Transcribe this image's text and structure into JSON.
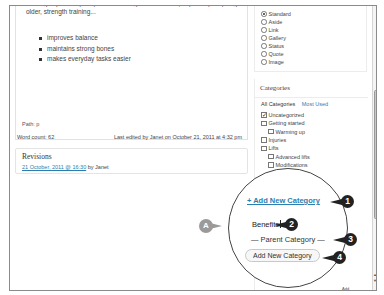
{
  "editor": {
    "cut_line": "training improves quality of life. Among other benefits, especially as you get",
    "intro_line": "older, strength training...",
    "bullets": [
      "improves balance",
      "maintains strong bones",
      "makes everyday tasks easier"
    ],
    "path": "Path: p",
    "word_count": "Word count: 62",
    "last_edited": "Last edited by Janet on October 21, 2011 at 4:32 pm"
  },
  "revisions": {
    "title": "Revisions",
    "entry_link": "21 October, 2011 @ 16:30",
    "entry_suffix": " by Janet"
  },
  "format": {
    "options": [
      {
        "label": "Standard",
        "selected": true
      },
      {
        "label": "Aside",
        "selected": false
      },
      {
        "label": "Link",
        "selected": false
      },
      {
        "label": "Gallery",
        "selected": false
      },
      {
        "label": "Status",
        "selected": false
      },
      {
        "label": "Quote",
        "selected": false
      },
      {
        "label": "Image",
        "selected": false
      }
    ]
  },
  "categories": {
    "title": "Categories",
    "tabs": [
      "All Categories",
      "Most Used"
    ],
    "items": [
      {
        "label": "Uncategorized",
        "checked": true,
        "child": false
      },
      {
        "label": "Getting started",
        "checked": false,
        "child": false
      },
      {
        "label": "Warming up",
        "checked": false,
        "child": true
      },
      {
        "label": "Injuries",
        "checked": false,
        "child": false
      },
      {
        "label": "Lifts",
        "checked": false,
        "child": false
      },
      {
        "label": "Advanced lifts",
        "checked": false,
        "child": true
      },
      {
        "label": "Modifications",
        "checked": false,
        "child": true
      }
    ]
  },
  "magnifier": {
    "add_link": "+ Add New Category",
    "input_value": "Benefits",
    "parent_select": "— Parent Category —",
    "add_button": "Add New Category"
  },
  "callouts": {
    "a": "A",
    "one": "1",
    "two": "2",
    "three": "3",
    "four": "4"
  },
  "scrollbar": {
    "up": "▲",
    "down": "▼"
  },
  "bottom_label": "Add"
}
